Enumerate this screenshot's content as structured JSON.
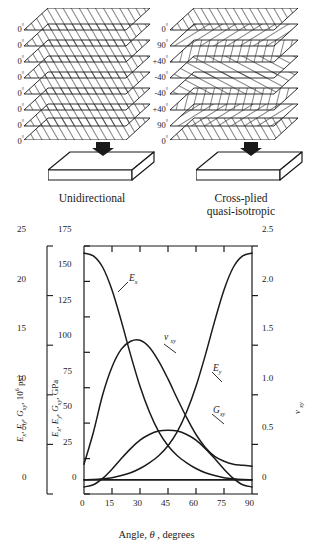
{
  "laminate": {
    "unidirectional": {
      "caption": "Unidirectional",
      "ply_angles": [
        "0",
        "0",
        "0",
        "0",
        "0",
        "0",
        "0",
        "0"
      ],
      "degree_symbol": "°",
      "plate_name": "unidirectional-plate",
      "load_arrow": "down-arrow"
    },
    "crossplied": {
      "caption_line1": "Cross-plied",
      "caption_line2": "quasi-isotropic",
      "ply_angles": [
        "0",
        "90",
        "+40",
        "-40",
        "-40",
        "+40",
        "90",
        "0"
      ],
      "degree_symbol": "°",
      "plate_name": "crossplied-plate",
      "load_arrow": "down-arrow"
    }
  },
  "chart_data": {
    "type": "line",
    "title": "",
    "xlabel": "Angle, θ , degrees",
    "xlabel_parts": {
      "pre": "Angle, ",
      "symbol": "θ",
      "post": " , degrees"
    },
    "xlim": [
      0,
      90
    ],
    "xticks": [
      0,
      15,
      30,
      45,
      60,
      75,
      90
    ],
    "xticklabels": [
      "0",
      "15",
      "30",
      "45",
      "60",
      "75",
      "90"
    ],
    "grid": false,
    "legend": "inline-annotations",
    "axes": [
      {
        "id": "left-outer",
        "name": "psi-axis",
        "label": "Ex, Ey, Gxy, 10^6 psi",
        "label_parts": {
          "e1": "E",
          "s1": "x",
          "e2": "E",
          "s2": "y",
          "g": "G",
          "s3": "xy",
          "unit_pre": ", 10",
          "unit_sup": "6",
          "unit_post": " psi"
        },
        "lim": [
          0,
          25
        ],
        "ticks": [
          0,
          5,
          10,
          15,
          20,
          25
        ],
        "ticklabels": [
          "0",
          "5",
          "10",
          "15",
          "20",
          "25"
        ]
      },
      {
        "id": "left-inner",
        "name": "gpa-axis",
        "label": "Ex, Ey, Gxy, GPa",
        "label_parts": {
          "e1": "E",
          "s1": "x",
          "e2": "E",
          "s2": "y",
          "g": "G",
          "s3": "xy",
          "unit": ", GPa"
        },
        "lim": [
          0,
          175
        ],
        "ticks": [
          0,
          25,
          50,
          75,
          100,
          125,
          150,
          175
        ],
        "ticklabels": [
          "0",
          "25",
          "50",
          "75",
          "100",
          "125",
          "150",
          "175"
        ]
      },
      {
        "id": "right",
        "name": "poisson-axis",
        "label": "ν xy",
        "label_parts": {
          "nu": "ν",
          "sub": "xy"
        },
        "lim": [
          0,
          2.5
        ],
        "ticks": [
          0,
          0.5,
          1.0,
          1.5,
          2.0,
          2.5
        ],
        "ticklabels": [
          "0",
          "0.5",
          "1.0",
          "1.5",
          "2.0",
          "2.5"
        ]
      }
    ],
    "x": [
      0,
      5,
      10,
      15,
      20,
      25,
      30,
      35,
      40,
      45,
      50,
      55,
      60,
      65,
      70,
      75,
      80,
      85,
      90
    ],
    "series": [
      {
        "name": "Ex",
        "label": "Ex",
        "label_parts": {
          "base": "E",
          "sub": "x"
        },
        "axis": "left-inner",
        "unit": "GPa",
        "values": [
          170,
          168,
          160,
          144,
          122,
          98,
          76,
          58,
          44,
          34,
          27,
          22,
          18,
          15,
          13,
          11.5,
          10.7,
          10.2,
          10
        ]
      },
      {
        "name": "Ey",
        "label": "Ey",
        "label_parts": {
          "base": "E",
          "sub": "y"
        },
        "axis": "left-inner",
        "unit": "GPa",
        "values": [
          10,
          10.2,
          10.7,
          11.5,
          13,
          15,
          18,
          22,
          27,
          34,
          44,
          58,
          76,
          98,
          122,
          144,
          160,
          168,
          170
        ]
      },
      {
        "name": "Gxy",
        "label": "Gxy",
        "label_parts": {
          "base": "G",
          "sub": "xy"
        },
        "axis": "left-inner",
        "unit": "GPa",
        "values": [
          5,
          6.5,
          11,
          17.5,
          25,
          32,
          38,
          42,
          44.5,
          45,
          44.5,
          42,
          38,
          32,
          25,
          17.5,
          11,
          6.5,
          5
        ]
      },
      {
        "name": "nu_xy",
        "label": "ν xy",
        "label_parts": {
          "base": "ν",
          "sub": "xy"
        },
        "axis": "right",
        "unit": "",
        "values": [
          0.3,
          0.62,
          1.0,
          1.28,
          1.46,
          1.54,
          1.55,
          1.48,
          1.34,
          1.16,
          0.96,
          0.77,
          0.6,
          0.47,
          0.38,
          0.33,
          0.3,
          0.29,
          0.28
        ]
      },
      {
        "name": "baseline",
        "label": "",
        "axis": "left-inner",
        "unit": "GPa",
        "values": [
          10,
          10,
          10,
          10,
          10,
          10,
          10,
          10,
          10,
          10,
          10,
          10,
          10,
          10,
          10,
          10,
          10,
          10,
          10
        ]
      }
    ],
    "annotations": [
      {
        "text": "Ex",
        "x": 22,
        "y_axis": "left-inner",
        "y": 133
      },
      {
        "text": "ν xy",
        "x": 47,
        "y_axis": "right",
        "y": 1.52
      },
      {
        "text": "Ey",
        "x": 72,
        "y_axis": "left-inner",
        "y": 82
      },
      {
        "text": "Gxy",
        "x": 74,
        "y_axis": "left-inner",
        "y": 40
      }
    ]
  },
  "colors": {
    "ink": "#1a1a1a",
    "paper": "#ffffff",
    "hatch": "#222222"
  }
}
